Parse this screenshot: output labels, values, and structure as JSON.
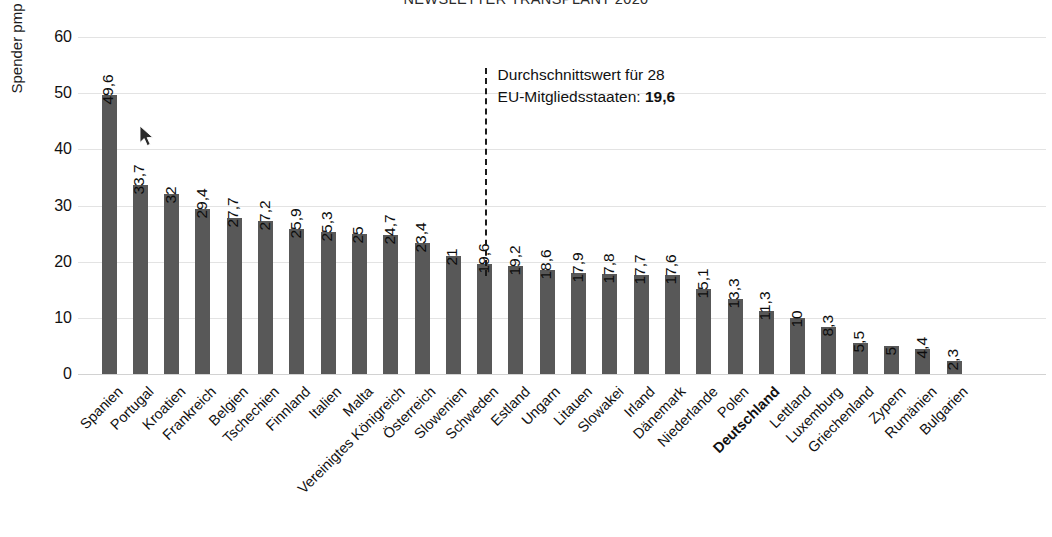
{
  "title": "NEWSLETTER TRANSPLANT 2020",
  "y_axis_title": "Spender pmp",
  "annotation": {
    "line1": "Durchschnittswert für 28",
    "line2_prefix": "EU-Mitgliedsstaaten: ",
    "line2_value": "19,6"
  },
  "colors": {
    "bar": "#585858",
    "gridline": "#e3e3e3",
    "text": "#111111"
  },
  "chart_data": {
    "type": "bar",
    "title": "NEWSLETTER TRANSPLANT 2020",
    "xlabel": "",
    "ylabel": "Spender pmp",
    "ylim": [
      0,
      60
    ],
    "yticks": [
      0,
      10,
      20,
      30,
      40,
      50,
      60
    ],
    "ytick_labels": [
      "0",
      "10",
      "20",
      "30",
      "40",
      "50",
      "60"
    ],
    "grid": true,
    "legend": "none",
    "highlight_category": "Deutschland",
    "reference_line": {
      "label": "Durchschnittswert für 28 EU-Mitgliedsstaaten",
      "value": 19.6,
      "value_label": "19,6",
      "style": "dashed-vertical"
    },
    "categories": [
      "Spanien",
      "Portugal",
      "Kroatien",
      "Frankreich",
      "Belgien",
      "Tschechien",
      "Finnland",
      "Italien",
      "Malta",
      "Vereinigtes Königreich",
      "Österreich",
      "Slowenien",
      "Schweden",
      "Estland",
      "Ungarn",
      "Litauen",
      "Slowakei",
      "Irland",
      "Dänemark",
      "Niederlande",
      "Polen",
      "Deutschland",
      "Lettland",
      "Luxemburg",
      "Griechenland",
      "Zypern",
      "Rumänien",
      "Bulgarien"
    ],
    "values": [
      49.6,
      33.7,
      32,
      29.4,
      27.7,
      27.2,
      25.9,
      25.3,
      25,
      24.7,
      23.4,
      21,
      19.6,
      19.2,
      18.6,
      17.9,
      17.8,
      17.7,
      17.6,
      15.1,
      13.3,
      11.3,
      10,
      8.3,
      5.5,
      5,
      4.4,
      2.3
    ],
    "value_labels": [
      "49,6",
      "33,7",
      "32",
      "29,4",
      "27,7",
      "27,2",
      "25,9",
      "25,3",
      "25",
      "24,7",
      "23,4",
      "21",
      "19,6",
      "19,2",
      "18,6",
      "17,9",
      "17,8",
      "17,7",
      "17,6",
      "15,1",
      "13,3",
      "11,3",
      "10",
      "8,3",
      "5,5",
      "5",
      "4,4",
      "2,3"
    ]
  }
}
